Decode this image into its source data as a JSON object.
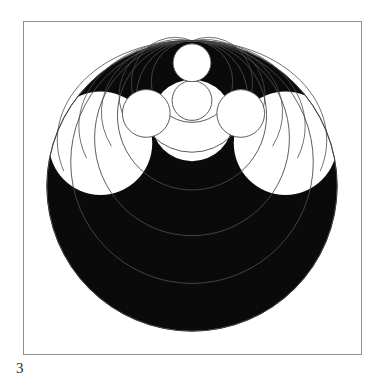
{
  "page": {
    "width": 386,
    "height": 379,
    "background_color": "#ffffff"
  },
  "caption": {
    "text": "3",
    "name": "figure-number-caption"
  },
  "frame": {
    "name": "figure-border",
    "x": 23,
    "y": 21,
    "width": 339,
    "height": 334,
    "stroke_color": "#8e8e8e",
    "stroke_width": 1,
    "fill_color": "#ffffff"
  },
  "figure": {
    "ink_color": "#0a0a0a",
    "line_color": "#4a4a4a",
    "fill_white": "#ffffff",
    "viewbox": "0 0 339 334",
    "outer_circle": {
      "name": "outer-black-disc",
      "cx": 169,
      "cy": 165,
      "r": 146,
      "fill": "#0a0a0a"
    },
    "apex_point": {
      "name": "tangency-apex",
      "x": 169,
      "y": 19
    },
    "chain_circles": [
      {
        "name": "chain-circle-top",
        "cx": 169,
        "cy": 41,
        "r": 19,
        "fill": "#ffffff"
      },
      {
        "name": "chain-circle-second",
        "cx": 169,
        "cy": 79,
        "r": 20,
        "fill": "#ffffff"
      },
      {
        "name": "chain-circle-left",
        "cx": 123,
        "cy": 92,
        "r": 24,
        "fill": "#ffffff"
      },
      {
        "name": "chain-circle-right",
        "cx": 218,
        "cy": 92,
        "r": 24,
        "fill": "#ffffff"
      }
    ],
    "lobe_circles": [
      {
        "name": "lobe-left",
        "cx": 77,
        "cy": 122,
        "r": 52,
        "fill": "#ffffff"
      },
      {
        "name": "lobe-right",
        "cx": 263,
        "cy": 122,
        "r": 52,
        "fill": "#ffffff"
      },
      {
        "name": "lobe-center",
        "cx": 169,
        "cy": 99,
        "r": 41,
        "fill": "#ffffff"
      }
    ],
    "arc_circles": [
      {
        "name": "arc-circle-1",
        "cx": 169,
        "cy": 60,
        "r": 41
      },
      {
        "name": "arc-circle-2",
        "cx": 169,
        "cy": 75,
        "r": 56
      },
      {
        "name": "arc-circle-3",
        "cx": 169,
        "cy": 94,
        "r": 75
      },
      {
        "name": "arc-circle-4",
        "cx": 169,
        "cy": 117,
        "r": 98
      },
      {
        "name": "arc-circle-5",
        "cx": 169,
        "cy": 141,
        "r": 122
      },
      {
        "name": "arc-circle-6",
        "cx": 169,
        "cy": 165,
        "r": 146
      }
    ],
    "ellipse_arcs": [
      {
        "name": "sweep-arc-outer",
        "rx": 146,
        "ry": 132
      },
      {
        "name": "sweep-arc-mid",
        "rx": 122,
        "ry": 112
      },
      {
        "name": "sweep-arc-inner",
        "rx": 98,
        "ry": 92
      },
      {
        "name": "sweep-arc-small",
        "rx": 75,
        "ry": 72
      },
      {
        "name": "sweep-arc-tiny",
        "rx": 56,
        "ry": 55
      }
    ]
  }
}
